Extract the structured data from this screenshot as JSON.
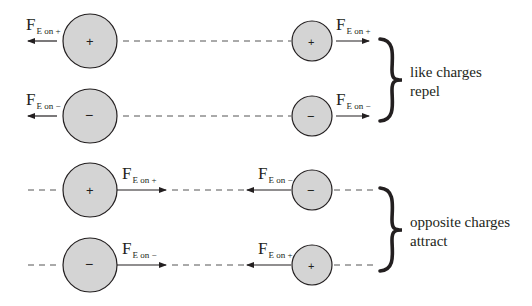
{
  "colors": {
    "charge_fill": "#d4d4d4",
    "stroke": "#231f20",
    "dash": "#555555",
    "background": "#ffffff"
  },
  "groups": [
    {
      "name": "like charges",
      "caption_line1": "like charges",
      "caption_line2": "repel",
      "rows": [
        {
          "left_charge": "+",
          "right_charge": "+",
          "left_force": {
            "main": "F",
            "sub": "E on +",
            "direction": "left"
          },
          "right_force": {
            "main": "F",
            "sub": "E on +",
            "direction": "right"
          }
        },
        {
          "left_charge": "−",
          "right_charge": "−",
          "left_force": {
            "main": "F",
            "sub": "E on −",
            "direction": "left"
          },
          "right_force": {
            "main": "F",
            "sub": "E on −",
            "direction": "right"
          }
        }
      ]
    },
    {
      "name": "opposite charges",
      "caption_line1": "opposite charges",
      "caption_line2": "attract",
      "rows": [
        {
          "left_charge": "+",
          "right_charge": "−",
          "left_force": {
            "main": "F",
            "sub": "E on +",
            "direction": "right"
          },
          "right_force": {
            "main": "F",
            "sub": "E on −",
            "direction": "left"
          }
        },
        {
          "left_charge": "−",
          "right_charge": "+",
          "left_force": {
            "main": "F",
            "sub": "E on −",
            "direction": "right"
          },
          "right_force": {
            "main": "F",
            "sub": "E on +",
            "direction": "left"
          }
        }
      ]
    }
  ]
}
